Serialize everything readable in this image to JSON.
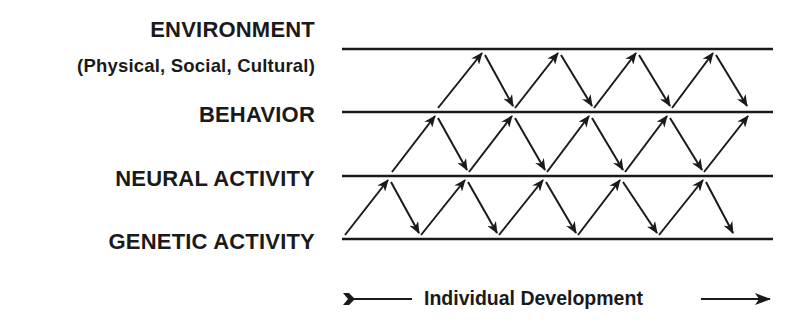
{
  "levels": [
    {
      "name": "environment",
      "label": "ENVIRONMENT",
      "sublabel": "(Physical, Social, Cultural)"
    },
    {
      "name": "behavior",
      "label": "BEHAVIOR"
    },
    {
      "name": "neural",
      "label": "NEURAL ACTIVITY"
    },
    {
      "name": "genetic",
      "label": "GENETIC ACTIVITY"
    }
  ],
  "legend": {
    "label": "Individual Development",
    "direction": "left-to-right"
  },
  "interactions": {
    "description": "Bidirectional zig-zag arrows between adjacent levels over the course of development",
    "rows": [
      {
        "between": [
          "genetic",
          "neural"
        ],
        "arrow_count": 10
      },
      {
        "between": [
          "neural",
          "behavior"
        ],
        "arrow_count": 9
      },
      {
        "between": [
          "behavior",
          "environment"
        ],
        "arrow_count": 8
      }
    ]
  },
  "colors": {
    "ink": "#1a1a1a",
    "background": "#ffffff"
  }
}
